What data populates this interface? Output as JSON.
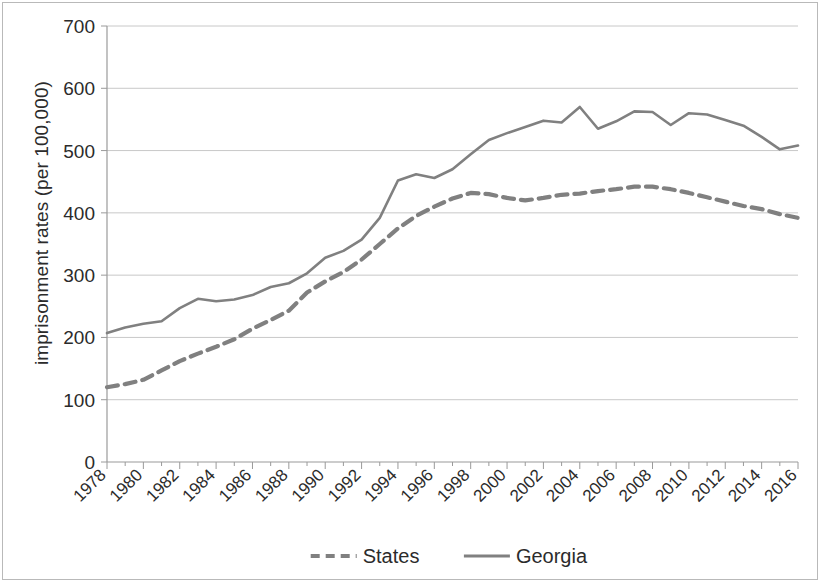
{
  "chart_data": {
    "type": "line",
    "title": "",
    "xlabel": "",
    "ylabel": "imprisonment rates (per 100,000)",
    "ylim": [
      0,
      700
    ],
    "ytick_values": [
      0,
      100,
      200,
      300,
      400,
      500,
      600,
      700
    ],
    "ytick_labels": [
      "0",
      "100",
      "200",
      "300",
      "400",
      "500",
      "600",
      "700"
    ],
    "xlim": [
      1978,
      2016
    ],
    "grid": true,
    "grid_axis": "y",
    "legend_position": "bottom",
    "x": [
      1978,
      1979,
      1980,
      1981,
      1982,
      1983,
      1984,
      1985,
      1986,
      1987,
      1988,
      1989,
      1990,
      1991,
      1992,
      1993,
      1994,
      1995,
      1996,
      1997,
      1998,
      1999,
      2000,
      2001,
      2002,
      2003,
      2004,
      2005,
      2006,
      2007,
      2008,
      2009,
      2010,
      2011,
      2012,
      2013,
      2014,
      2015,
      2016
    ],
    "xtick_labels": [
      "1978",
      "1980",
      "1982",
      "1984",
      "1986",
      "1988",
      "1990",
      "1992",
      "1994",
      "1996",
      "1998",
      "2000",
      "2002",
      "2004",
      "2006",
      "2008",
      "2010",
      "2012",
      "2014",
      "2016"
    ],
    "series": [
      {
        "name": "States",
        "style": "dashed",
        "color": "#808080",
        "values": [
          120,
          125,
          132,
          147,
          162,
          174,
          185,
          197,
          214,
          228,
          243,
          272,
          290,
          305,
          325,
          350,
          375,
          395,
          410,
          423,
          432,
          430,
          424,
          420,
          424,
          429,
          431,
          435,
          438,
          442,
          442,
          438,
          432,
          425,
          418,
          411,
          406,
          398,
          392
        ]
      },
      {
        "name": "Georgia",
        "style": "solid",
        "color": "#808080",
        "values": [
          207,
          216,
          222,
          226,
          247,
          262,
          258,
          261,
          268,
          281,
          287,
          303,
          328,
          339,
          357,
          392,
          452,
          462,
          456,
          470,
          494,
          517,
          528,
          538,
          548,
          545,
          570,
          535,
          547,
          563,
          562,
          541,
          560,
          558,
          549,
          540,
          522,
          502,
          508
        ]
      }
    ]
  },
  "legend": {
    "items": [
      {
        "label": "States",
        "style": "dashed"
      },
      {
        "label": "Georgia",
        "style": "solid"
      }
    ]
  },
  "colors": {
    "series": "#808080",
    "grid": "#c8c8c8",
    "axis": "#9a9a9a",
    "text": "#2b2b2b",
    "background": "#ffffff"
  }
}
